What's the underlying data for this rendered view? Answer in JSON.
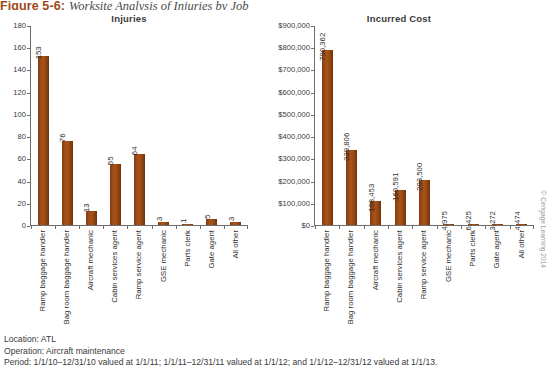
{
  "figure": {
    "number": "Figure 5-6:",
    "title": "Worksite Analysis of Injuries by Job"
  },
  "footnotes": {
    "location": "Location: ATL",
    "operation": "Operation: Aircraft maintenance",
    "period": "Period: 1/1/10–12/31/10 valued at 1/1/11; 1/1/11–12/31/11 valued at 1/1/12; and 1/1/12–12/31/12 valued at 1/1/13."
  },
  "credit": "© Cengage Learning 2014",
  "colors": {
    "bar": "#a85318",
    "caption_accent": "#9c4a1a",
    "axis": "#6d6d6d",
    "text": "#3a3a3a"
  },
  "chart_data": [
    {
      "type": "bar",
      "title": "Injuries",
      "xlabel": "",
      "ylabel": "",
      "ylim": [
        0,
        180
      ],
      "yticks": [
        "0",
        "20",
        "40",
        "60",
        "80",
        "100",
        "120",
        "140",
        "160",
        "180"
      ],
      "grid": false,
      "legend": "none",
      "categories": [
        "Ramp baggage handler",
        "Bag room baggage handler",
        "Aircraft mechanic",
        "Cabin services agent",
        "Ramp service agent",
        "GSE mechanic",
        "Parts clerk",
        "Gate agent",
        "All other"
      ],
      "values": [
        153,
        76,
        13,
        55,
        64,
        3,
        1,
        5,
        3
      ],
      "value_labels": [
        "153",
        "76",
        "13",
        "55",
        "64",
        "3",
        "1",
        "5",
        "3"
      ]
    },
    {
      "type": "bar",
      "title": "Incurred Cost",
      "xlabel": "",
      "ylabel": "",
      "ylim": [
        0,
        900000
      ],
      "yticks": [
        "$0",
        "$100,000",
        "$200,000",
        "$300,000",
        "$400,000",
        "$500,000",
        "$600,000",
        "$700,000",
        "$800,000",
        "$900,000"
      ],
      "grid": false,
      "legend": "none",
      "categories": [
        "Ramp baggage handler",
        "Bag room baggage handler",
        "Aircraft mechanic",
        "Cabin services agent",
        "Ramp service agent",
        "GSE mechanic",
        "Parts clerk",
        "Gate agent",
        "All other"
      ],
      "values": [
        790362,
        339806,
        108453,
        160591,
        203500,
        4975,
        6425,
        3272,
        4474
      ],
      "value_labels": [
        "790,362",
        "339,806",
        "108,453",
        "160,591",
        "203,500",
        "4,975",
        "6,425",
        "3,272",
        "4,474"
      ]
    }
  ]
}
